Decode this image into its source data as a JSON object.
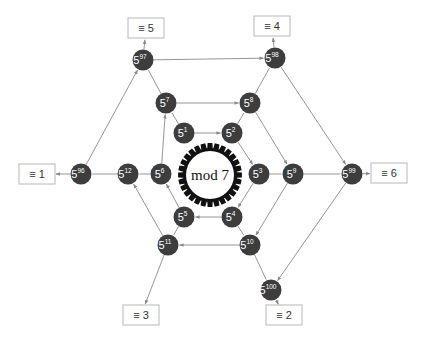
{
  "diagram": {
    "center_label": "mod 7",
    "base": "5",
    "colors": {
      "node": "#3d3d3d",
      "node_text": "#ffffff",
      "edge": "#8a8a8a",
      "gear": "#111111",
      "box_border": "#b8b8b8"
    },
    "nodes": [
      {
        "id": "p1",
        "exp": "1",
        "x": 184,
        "y": 133
      },
      {
        "id": "p2",
        "exp": "2",
        "x": 232,
        "y": 133
      },
      {
        "id": "p3",
        "exp": "3",
        "x": 259,
        "y": 174
      },
      {
        "id": "p4",
        "exp": "4",
        "x": 232,
        "y": 217
      },
      {
        "id": "p5",
        "exp": "5",
        "x": 184,
        "y": 217
      },
      {
        "id": "p6",
        "exp": "6",
        "x": 161,
        "y": 174
      },
      {
        "id": "p7",
        "exp": "7",
        "x": 166,
        "y": 103
      },
      {
        "id": "p8",
        "exp": "8",
        "x": 250,
        "y": 103
      },
      {
        "id": "p9",
        "exp": "9",
        "x": 293,
        "y": 174
      },
      {
        "id": "p10",
        "exp": "10",
        "x": 250,
        "y": 245
      },
      {
        "id": "p11",
        "exp": "11",
        "x": 168,
        "y": 245
      },
      {
        "id": "p12",
        "exp": "12",
        "x": 128,
        "y": 174
      },
      {
        "id": "p96",
        "exp": "96",
        "x": 81,
        "y": 174
      },
      {
        "id": "p97",
        "exp": "97",
        "x": 143,
        "y": 60
      },
      {
        "id": "p98",
        "exp": "98",
        "x": 275,
        "y": 58
      },
      {
        "id": "p99",
        "exp": "99",
        "x": 352,
        "y": 174
      },
      {
        "id": "p100",
        "exp": "100",
        "x": 271,
        "y": 290
      }
    ],
    "results": [
      {
        "label": "≡ 1",
        "for": "p96",
        "x": 37,
        "y": 174
      },
      {
        "label": "≡ 5",
        "for": "p97",
        "x": 146,
        "y": 28
      },
      {
        "label": "≡ 4",
        "for": "p98",
        "x": 272,
        "y": 26
      },
      {
        "label": "≡ 6",
        "for": "p99",
        "x": 389,
        "y": 173
      },
      {
        "label": "≡ 2",
        "for": "p100",
        "x": 284,
        "y": 315
      },
      {
        "label": "≡ 3",
        "for": "p11",
        "x": 141,
        "y": 315
      }
    ],
    "edges": [
      {
        "from": "p1",
        "to": "p2",
        "arrow": true
      },
      {
        "from": "p2",
        "to": "p3",
        "arrow": true
      },
      {
        "from": "p3",
        "to": "p4",
        "arrow": true
      },
      {
        "from": "p4",
        "to": "p5",
        "arrow": true
      },
      {
        "from": "p5",
        "to": "p6",
        "arrow": true
      },
      {
        "from": "p6",
        "to": "p7",
        "arrow": true
      },
      {
        "from": "p7",
        "to": "p8",
        "arrow": true
      },
      {
        "from": "p8",
        "to": "p9",
        "arrow": true
      },
      {
        "from": "p9",
        "to": "p10",
        "arrow": true
      },
      {
        "from": "p10",
        "to": "p11",
        "arrow": true
      },
      {
        "from": "p11",
        "to": "p12",
        "arrow": true
      },
      {
        "from": "p96",
        "to": "p97",
        "arrow": true
      },
      {
        "from": "p97",
        "to": "p98",
        "arrow": true
      },
      {
        "from": "p98",
        "to": "p99",
        "arrow": true
      },
      {
        "from": "p99",
        "to": "p100",
        "arrow": true
      },
      {
        "from": "p1",
        "to": "p7",
        "arrow": false
      },
      {
        "from": "p7",
        "to": "p97",
        "arrow": false
      },
      {
        "from": "p2",
        "to": "p8",
        "arrow": false
      },
      {
        "from": "p8",
        "to": "p98",
        "arrow": false
      },
      {
        "from": "p3",
        "to": "p9",
        "arrow": false
      },
      {
        "from": "p9",
        "to": "p99",
        "arrow": false
      },
      {
        "from": "p4",
        "to": "p10",
        "arrow": false
      },
      {
        "from": "p10",
        "to": "p100",
        "arrow": false
      },
      {
        "from": "p5",
        "to": "p11",
        "arrow": false
      },
      {
        "from": "p6",
        "to": "p12",
        "arrow": false
      },
      {
        "from": "p12",
        "to": "p96",
        "arrow": false
      }
    ]
  }
}
